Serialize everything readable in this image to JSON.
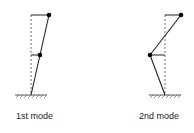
{
  "diagram": {
    "colors": {
      "line": "#222222",
      "dashed": "#888888",
      "mass": "#000000",
      "ground": "#555555"
    },
    "modes": [
      {
        "label": "1st mode",
        "displacements": {
          "floor1": 0.45,
          "floor2": 0.9
        }
      },
      {
        "label": "2nd mode",
        "displacements": {
          "floor1": -0.75,
          "floor2": 0.8
        }
      }
    ]
  }
}
